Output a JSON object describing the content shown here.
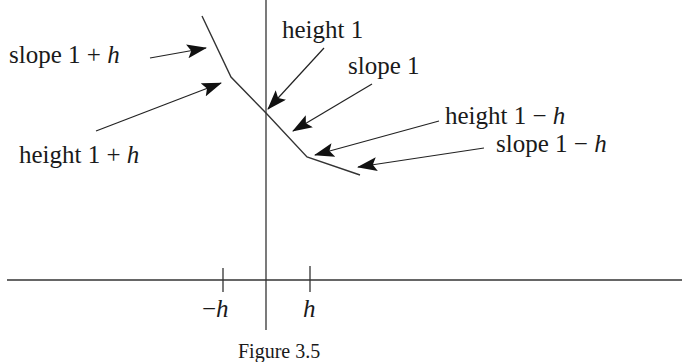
{
  "figure": {
    "caption": "Figure 3.5",
    "labels": {
      "slope_left": {
        "prefix": "slope 1 + ",
        "var": "h"
      },
      "height_left": {
        "prefix": "height 1 + ",
        "var": "h"
      },
      "height_center": {
        "prefix": "height 1",
        "var": ""
      },
      "slope_center": {
        "prefix": "slope 1",
        "var": ""
      },
      "height_right": {
        "prefix": "height 1 − ",
        "var": "h"
      },
      "slope_right": {
        "prefix": "slope 1 − ",
        "var": "h"
      }
    },
    "ticks": {
      "neg": {
        "sign": "−",
        "var": "h"
      },
      "pos": {
        "sign": "",
        "var": "h"
      }
    },
    "colors": {
      "line": "#333333",
      "arrow": "#111111",
      "text": "#1a1a1a"
    }
  }
}
